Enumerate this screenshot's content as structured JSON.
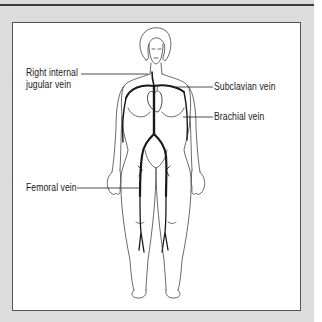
{
  "diagram": {
    "title": "",
    "colors": {
      "page_background": "#dcdcdc",
      "panel_background": "#ffffff",
      "vein": "#1a1a1a",
      "outline": "#444444",
      "top_rule": "#3a3a3a"
    },
    "labels": [
      {
        "id": "right-internal-jugular-vein",
        "line1": "Right internal",
        "line2": "jugular vein"
      },
      {
        "id": "subclavian-vein",
        "line1": "Subclavian vein"
      },
      {
        "id": "brachial-vein",
        "line1": "Brachial vein"
      },
      {
        "id": "femoral-vein",
        "line1": "Femoral vein"
      }
    ]
  }
}
